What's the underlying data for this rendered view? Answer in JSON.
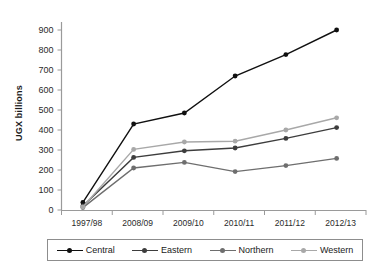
{
  "title_strip": "",
  "axes": {
    "ylabel": "UGX billions",
    "yticks": [
      "900",
      "800",
      "700",
      "600",
      "500",
      "400",
      "300",
      "200",
      "100",
      "0"
    ],
    "xticks": [
      "1997/98",
      "2008/09",
      "2009/10",
      "2010/11",
      "2011/12",
      "2012/13"
    ]
  },
  "legend": {
    "items": [
      {
        "label": "Central",
        "color": "#101010"
      },
      {
        "label": "Eastern",
        "color": "#3d3d3d"
      },
      {
        "label": "Northern",
        "color": "#6e6e6e"
      },
      {
        "label": "Western",
        "color": "#a8a8a8"
      }
    ]
  },
  "chart_data": {
    "type": "line",
    "title": "",
    "xlabel": "",
    "ylabel": "UGX billions",
    "ylim": [
      0,
      900
    ],
    "grid": false,
    "legend_position": "bottom",
    "categories": [
      "1997/98",
      "2008/09",
      "2009/10",
      "2010/11",
      "2011/12",
      "2012/13"
    ],
    "series": [
      {
        "name": "Central",
        "color": "#101010",
        "values": [
          38,
          430,
          485,
          670,
          777,
          900
        ]
      },
      {
        "name": "Eastern",
        "color": "#3d3d3d",
        "values": [
          20,
          263,
          296,
          310,
          358,
          412
        ]
      },
      {
        "name": "Northern",
        "color": "#6e6e6e",
        "values": [
          12,
          210,
          238,
          192,
          222,
          258
        ]
      },
      {
        "name": "Western",
        "color": "#a8a8a8",
        "values": [
          15,
          303,
          340,
          344,
          400,
          461
        ]
      }
    ]
  }
}
